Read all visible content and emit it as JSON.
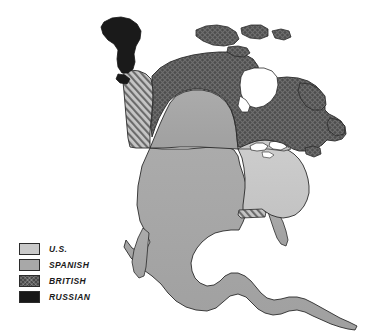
{
  "figure": {
    "background_color": "#ffffff",
    "border_color": "#e3e3e3",
    "width": 389,
    "height": 334
  },
  "legend": {
    "position": "bottom-left",
    "items": [
      {
        "label": "U.S.",
        "key": "us",
        "fill_class": "fill-us",
        "color": "#c9c9c9",
        "pattern": "solid"
      },
      {
        "label": "SPANISH",
        "key": "spanish",
        "fill_class": "fill-spanish",
        "color": "#a8a8a8",
        "pattern": "solid"
      },
      {
        "label": "BRITISH",
        "key": "british",
        "fill_class": "fill-british",
        "color": "#4a4a4a",
        "pattern": "cross-hatch"
      },
      {
        "label": "RUSSIAN",
        "key": "russian",
        "fill_class": "fill-russian",
        "color": "#181818",
        "pattern": "solid"
      }
    ]
  },
  "map": {
    "title": "",
    "projection_note": "",
    "outline_color": "#2a2a2a",
    "water_color": "#ffffff",
    "regions": [
      {
        "name": "Russian America (Alaska)",
        "key": "russian",
        "fill_class": "fill-russian"
      },
      {
        "name": "British North America",
        "key": "british",
        "fill_class": "fill-british"
      },
      {
        "name": "Oregon Country (disputed)",
        "key": "disputed",
        "fill_class": "fill-disputed"
      },
      {
        "name": "Spanish Territory",
        "key": "spanish",
        "fill_class": "fill-spanish"
      },
      {
        "name": "United States",
        "key": "us",
        "fill_class": "fill-us"
      },
      {
        "name": "West Florida (disputed)",
        "key": "disputed",
        "fill_class": "fill-disputed"
      }
    ]
  }
}
